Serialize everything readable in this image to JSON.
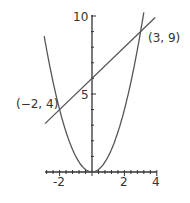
{
  "chart_data": {
    "type": "line",
    "title": "",
    "xlabel": "",
    "ylabel": "",
    "xlim": [
      -2.9,
      4
    ],
    "ylim": [
      0,
      10
    ],
    "grid": false,
    "x_ticks": [
      -2,
      2,
      4
    ],
    "x_tick_labels": [
      "-2",
      "2",
      "4"
    ],
    "y_ticks": [
      5,
      10
    ],
    "y_tick_labels": [
      "5",
      "10"
    ],
    "series": [
      {
        "name": "y = x^2",
        "kind": "parabola",
        "x_range": [
          -2.95,
          3.2
        ]
      },
      {
        "name": "y = x + 6",
        "kind": "line",
        "x_range": [
          -2.9,
          3.9
        ]
      }
    ],
    "annotations": [
      {
        "text": "(-2, 4)",
        "x": -2,
        "y": 4
      },
      {
        "text": "(3, 9)",
        "x": 3,
        "y": 9
      }
    ],
    "colors": {
      "curve": "#555555",
      "axis": "#333333",
      "text": "#333333"
    }
  },
  "labels": {
    "y10": "10",
    "y5": "5",
    "xm2": "-2",
    "x2": "2",
    "x4": "4",
    "pt1": "(−2, 4)",
    "pt2": "(3, 9)"
  }
}
